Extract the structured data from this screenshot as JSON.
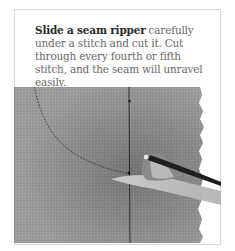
{
  "instruction": {
    "lead": "Slide a seam ripper",
    "body": " carefully under a stitch and cut it. Cut through every fourth or fifth stitch, and the seam will unravel easily."
  },
  "photo": {
    "subject": "seam-ripper-on-fabric",
    "fabric_color": "#9a9a9a",
    "seam_line_color": "#2c2c2c",
    "callout_line": "dotted-curve"
  },
  "colors": {
    "border": "#d8d8d8",
    "lead_text": "#2a2a2a",
    "body_text": "#6a6a6a"
  }
}
